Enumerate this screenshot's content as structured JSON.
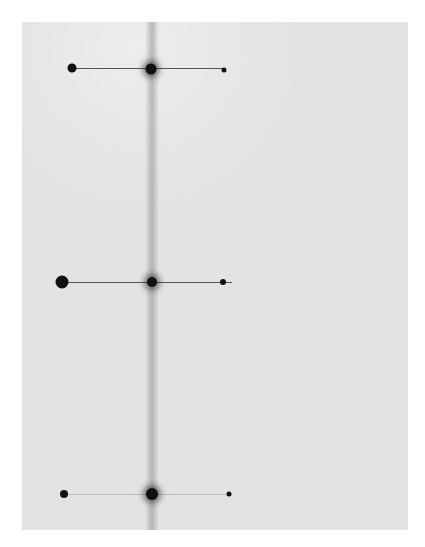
{
  "image": {
    "description": "Photographic plate with a vertical central streak and three rows of dark spots connected by horizontal lines",
    "background_color": "#e3e3e3",
    "spot_color": "#111111",
    "rows": [
      {
        "name": "top-row",
        "spots": [
          "left-spot",
          "center-spot",
          "right-spot"
        ]
      },
      {
        "name": "middle-row",
        "spots": [
          "left-spot",
          "center-spot",
          "right-spot"
        ]
      },
      {
        "name": "bottom-row",
        "spots": [
          "left-spot",
          "center-spot",
          "right-spot"
        ]
      }
    ]
  }
}
